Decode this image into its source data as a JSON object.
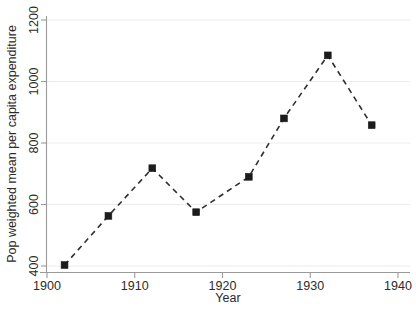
{
  "chart_data": {
    "type": "line",
    "title": "",
    "subtitle": "",
    "xlabel": "Year",
    "ylabel": "Pop  weighted mean per capita expenditure",
    "xlim": [
      1900,
      1940
    ],
    "ylim": [
      400,
      1200
    ],
    "xticks": [
      1900,
      1910,
      1920,
      1930,
      1940
    ],
    "yticks": [
      400,
      600,
      800,
      1000,
      1200
    ],
    "xtick_labels": [
      "1900",
      "1910",
      "1920",
      "1930",
      "1940"
    ],
    "ytick_labels": [
      "400",
      "600",
      "800",
      "1000",
      "1200"
    ],
    "grid": "horizontal",
    "legend": "none",
    "line_style": "dashed",
    "marker": "square",
    "series": [
      {
        "name": "Pop weighted mean per capita expenditure",
        "color": "#1c1c1c",
        "x": [
          1902,
          1907,
          1912,
          1917,
          1923,
          1927,
          1932,
          1937
        ],
        "values": [
          403,
          563,
          718,
          575,
          690,
          880,
          1085,
          858
        ]
      }
    ],
    "annotations": []
  },
  "axes": {
    "x_title": "Year",
    "y_title": "Pop  weighted mean per capita expenditure"
  }
}
